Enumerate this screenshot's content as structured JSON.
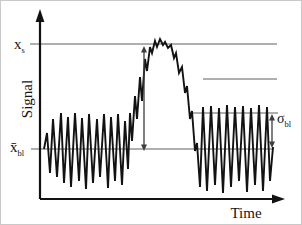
{
  "figure": {
    "background": "#ffffff",
    "border_color": "#c9c9c9",
    "ink_color": "#121212",
    "ref_line_color": "#5f5f5f",
    "arrow_color": "#3d3d3d",
    "labels": {
      "y_axis": "Signal",
      "x_axis": "Time",
      "signal_level": {
        "base": "x",
        "sub": "s"
      },
      "baseline_mean": {
        "base": "x̄",
        "sub": "bl"
      },
      "baseline_sd": {
        "base": "σ",
        "sub": "bl"
      }
    }
  },
  "chart_data": {
    "type": "line",
    "title": "",
    "xlabel": "Time",
    "ylabel": "Signal",
    "axis_ticks": "none",
    "grid": false,
    "legend": "none",
    "axes_px": {
      "y": {
        "x": 39,
        "y1": 198,
        "y2": 8
      },
      "x": {
        "y": 198,
        "x1": 39,
        "x2": 284
      }
    },
    "reference_lines": [
      {
        "name": "signal-level-line",
        "y": 43,
        "x1": 29,
        "x2": 276
      },
      {
        "name": "upper-right-line",
        "y": 78,
        "x1": 202,
        "x2": 276
      },
      {
        "name": "noise-top-line",
        "y": 112,
        "x1": 188,
        "x2": 277
      },
      {
        "name": "baseline-mean-line",
        "y": 148,
        "x1": 30,
        "x2": 273
      }
    ],
    "annotations": [
      {
        "name": "peak-height-arrow",
        "style": "double-arrow-vertical",
        "x": 143,
        "y1": 45,
        "y2": 150
      },
      {
        "name": "sigma-arrow",
        "style": "double-arrow-vertical",
        "x": 271,
        "y1": 113,
        "y2": 147
      }
    ],
    "series": [
      {
        "name": "signal-trace",
        "points_px": [
          [
            43,
            148
          ],
          [
            46,
            132
          ],
          [
            49,
            172
          ],
          [
            52,
            118
          ],
          [
            56,
            176
          ],
          [
            60,
            112
          ],
          [
            63,
            182
          ],
          [
            67,
            116
          ],
          [
            70,
            186
          ],
          [
            74,
            112
          ],
          [
            78,
            180
          ],
          [
            81,
            117
          ],
          [
            85,
            188
          ],
          [
            88,
            113
          ],
          [
            92,
            182
          ],
          [
            96,
            118
          ],
          [
            99,
            176
          ],
          [
            103,
            113
          ],
          [
            107,
            187
          ],
          [
            110,
            116
          ],
          [
            114,
            180
          ],
          [
            117,
            113
          ],
          [
            121,
            184
          ],
          [
            124,
            120
          ],
          [
            127,
            168
          ],
          [
            129,
            112
          ],
          [
            131,
            140
          ],
          [
            134,
            95
          ],
          [
            136,
            118
          ],
          [
            139,
            76
          ],
          [
            141,
            100
          ],
          [
            144,
            58
          ],
          [
            146,
            70
          ],
          [
            149,
            46
          ],
          [
            151,
            52
          ],
          [
            154,
            40
          ],
          [
            156,
            46
          ],
          [
            159,
            38
          ],
          [
            162,
            44
          ],
          [
            164,
            41
          ],
          [
            167,
            47
          ],
          [
            170,
            44
          ],
          [
            173,
            57
          ],
          [
            175,
            52
          ],
          [
            178,
            72
          ],
          [
            181,
            66
          ],
          [
            184,
            92
          ],
          [
            186,
            85
          ],
          [
            189,
            118
          ],
          [
            191,
            110
          ],
          [
            194,
            150
          ],
          [
            196,
            142
          ],
          [
            199,
            186
          ],
          [
            202,
            106
          ],
          [
            206,
            190
          ],
          [
            210,
            105
          ],
          [
            214,
            184
          ],
          [
            218,
            107
          ],
          [
            222,
            192
          ],
          [
            226,
            104
          ],
          [
            230,
            186
          ],
          [
            234,
            106
          ],
          [
            238,
            180
          ],
          [
            242,
            105
          ],
          [
            246,
            191
          ],
          [
            250,
            107
          ],
          [
            254,
            184
          ],
          [
            258,
            104
          ],
          [
            262,
            190
          ],
          [
            266,
            106
          ],
          [
            269,
            180
          ],
          [
            272,
            146
          ]
        ]
      }
    ]
  }
}
